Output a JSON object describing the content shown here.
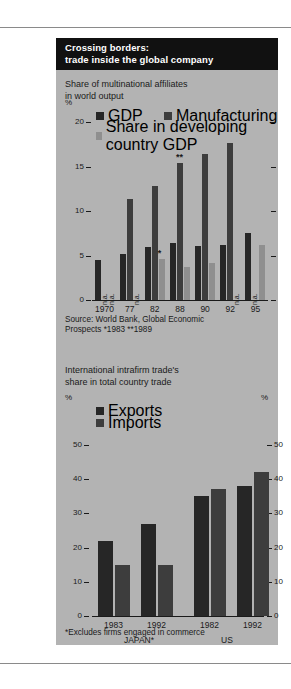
{
  "colors": {
    "panel_bg": "#b3b3b3",
    "title_bg": "#111111",
    "title_fg": "#ffffff",
    "gdp": "#262626",
    "manufacturing": "#3d3d3d",
    "developing": "#8f8f8f",
    "exports": "#262626",
    "imports": "#3d3d3d",
    "axis": "#1a1a1a",
    "rule": "#8a8a8a"
  },
  "title": "Crossing borders:\ntrade inside the global company",
  "chart1": {
    "subtitle": "Share  of multinational affiliates\nin world output",
    "unit_left": "%",
    "legend": [
      {
        "label": "GDP",
        "color": "#262626"
      },
      {
        "label": "Manufacturing",
        "color": "#3d3d3d"
      },
      {
        "label": "Share in developing country GDP",
        "color": "#8f8f8f"
      }
    ],
    "source": "Source: World Bank, Global Economic\nProspects *1983 **1989",
    "na_text": "n.a."
  },
  "chart2": {
    "subtitle": "International intrafirm trade's\nshare in total country trade",
    "unit_left": "%",
    "unit_right": "%",
    "legend": [
      {
        "label": "Exports",
        "color": "#262626"
      },
      {
        "label": "Imports",
        "color": "#3d3d3d"
      }
    ],
    "groups": [
      {
        "label": "JAPAN*"
      },
      {
        "label": "US"
      }
    ],
    "footnote": "*Excludes firms engaged in commerce"
  },
  "chart_data": [
    {
      "type": "bar",
      "id": "share-of-multinational-affiliates",
      "title": "Share  of multinational affiliates in world output",
      "xlabel": "",
      "ylabel": "%",
      "ylim": [
        0,
        20
      ],
      "yticks": [
        0,
        5,
        10,
        15,
        20
      ],
      "grid": false,
      "legend_position": "top",
      "categories": [
        "1970",
        "77",
        "82",
        "88",
        "90",
        "92",
        "95"
      ],
      "series": [
        {
          "name": "GDP",
          "color": "#262626",
          "values": [
            4.5,
            5.2,
            5.9,
            6.4,
            6.1,
            6.2,
            7.5
          ]
        },
        {
          "name": "Manufacturing",
          "color": "#3d3d3d",
          "values": [
            null,
            11.3,
            12.8,
            15.4,
            16.4,
            17.6,
            null
          ]
        },
        {
          "name": "Share in developing country GDP",
          "color": "#8f8f8f",
          "values": [
            null,
            null,
            4.6,
            3.7,
            4.2,
            null,
            6.2
          ]
        }
      ],
      "annotations": [
        {
          "text": "n.a.",
          "category": "1970",
          "series": "Manufacturing"
        },
        {
          "text": "n.a.",
          "category": "1970",
          "series": "Share in developing country GDP"
        },
        {
          "text": "n.a.",
          "category": "77",
          "series": "Share in developing country GDP"
        },
        {
          "text": "n.a.",
          "category": "88",
          "series": "Share in developing country GDP"
        },
        {
          "text": "n.a.",
          "category": "95",
          "series": "Manufacturing"
        },
        {
          "text": "*",
          "category": "82",
          "series": "Share in developing country GDP"
        },
        {
          "text": "**",
          "category": "88",
          "series": "Manufacturing"
        }
      ],
      "source": "Source: World Bank, Global Economic Prospects *1983 **1989"
    },
    {
      "type": "bar",
      "id": "international-intrafirm-trade-share",
      "title": "International intrafirm trade's share in total country trade",
      "xlabel": "",
      "ylabel": "%",
      "ylim": [
        0,
        50
      ],
      "yticks": [
        0,
        10,
        20,
        30,
        40,
        50
      ],
      "grid": false,
      "legend_position": "top",
      "categories": [
        "1983",
        "1992",
        "1982",
        "1992"
      ],
      "group_labels": [
        "JAPAN*",
        "US"
      ],
      "series": [
        {
          "name": "Exports",
          "color": "#262626",
          "values": [
            22.0,
            27.0,
            35.0,
            38.0
          ]
        },
        {
          "name": "Imports",
          "color": "#3d3d3d",
          "values": [
            15.0,
            15.0,
            37.0,
            42.0
          ]
        }
      ],
      "footnote": "*Excludes firms engaged in commerce"
    }
  ]
}
